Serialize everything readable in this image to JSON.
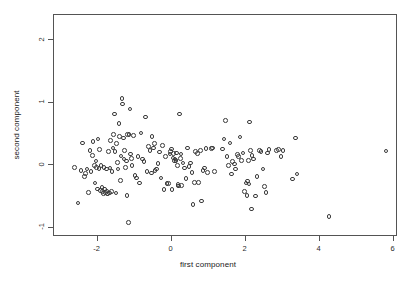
{
  "chart_data": {
    "type": "scatter",
    "title": "",
    "xlabel": "first component",
    "ylabel": "second component",
    "xlim": [
      -3.18,
      6.12
    ],
    "ylim": [
      -1.15,
      2.4
    ],
    "xticks": [
      -2,
      0,
      2,
      4,
      6
    ],
    "xticklabels": [
      "-2",
      "0",
      "2",
      "4",
      "6"
    ],
    "yticks": [
      2,
      1,
      0,
      -1
    ],
    "yticklabels": [
      "2",
      "1",
      "0",
      "-1"
    ],
    "grid": false,
    "legend": null,
    "marker": "open-circle",
    "marker_color": "#3a3a3a",
    "n_points": 178,
    "points": [
      [
        -2.6,
        -0.05
      ],
      [
        -2.5,
        -0.62
      ],
      [
        -2.42,
        -0.1
      ],
      [
        -2.38,
        0.34
      ],
      [
        -2.33,
        -0.2
      ],
      [
        -2.3,
        -0.15
      ],
      [
        -2.26,
        -0.08
      ],
      [
        -2.22,
        -0.45
      ],
      [
        -2.18,
        0.22
      ],
      [
        -2.15,
        -0.12
      ],
      [
        -2.12,
        0.14
      ],
      [
        -2.1,
        0.36
      ],
      [
        -2.06,
        -0.02
      ],
      [
        -2.04,
        -0.3
      ],
      [
        -2.02,
        0.05
      ],
      [
        -2.0,
        -0.05
      ],
      [
        -1.98,
        -0.4
      ],
      [
        -1.96,
        0.4
      ],
      [
        -1.94,
        -0.07
      ],
      [
        -1.92,
        0.23
      ],
      [
        -1.9,
        -0.42
      ],
      [
        -1.88,
        -0.02
      ],
      [
        -1.86,
        -0.37
      ],
      [
        -1.84,
        -0.44
      ],
      [
        -1.82,
        -0.47
      ],
      [
        -1.8,
        -0.05
      ],
      [
        -1.78,
        -0.4
      ],
      [
        -1.76,
        -0.45
      ],
      [
        -1.74,
        -0.08
      ],
      [
        -1.72,
        -0.43
      ],
      [
        -1.7,
        -0.48
      ],
      [
        -1.68,
        0.2
      ],
      [
        -1.66,
        -0.46
      ],
      [
        -1.64,
        -0.06
      ],
      [
        -1.62,
        0.38
      ],
      [
        -1.6,
        -0.44
      ],
      [
        -1.58,
        -0.12
      ],
      [
        -1.56,
        0.26
      ],
      [
        -1.54,
        0.47
      ],
      [
        -1.52,
        0.8
      ],
      [
        -1.5,
        0.2
      ],
      [
        -1.48,
        -0.46
      ],
      [
        -1.46,
        0.33
      ],
      [
        -1.44,
        0.03
      ],
      [
        -1.42,
        -0.08
      ],
      [
        -1.4,
        0.65
      ],
      [
        -1.38,
        0.44
      ],
      [
        -1.36,
        -0.26
      ],
      [
        -1.34,
        0.13
      ],
      [
        -1.32,
        1.05
      ],
      [
        -1.3,
        0.96
      ],
      [
        -1.28,
        0.42
      ],
      [
        -1.26,
        0.08
      ],
      [
        -1.24,
        0.22
      ],
      [
        -1.22,
        -0.05
      ],
      [
        -1.2,
        0.05
      ],
      [
        -1.18,
        -0.5
      ],
      [
        -1.16,
        0.47
      ],
      [
        -1.14,
        -0.93
      ],
      [
        -1.12,
        0.47
      ],
      [
        -1.1,
        0.88
      ],
      [
        -1.08,
        0.16
      ],
      [
        -1.06,
        0.09
      ],
      [
        -1.04,
        -0.02
      ],
      [
        -1.0,
        0.46
      ],
      [
        -0.96,
        -0.18
      ],
      [
        -0.92,
        -0.22
      ],
      [
        -0.88,
        0.12
      ],
      [
        -0.84,
        -0.3
      ],
      [
        -0.8,
        0.5
      ],
      [
        -0.76,
        0.08
      ],
      [
        -0.72,
        0.04
      ],
      [
        -0.68,
        0.75
      ],
      [
        -0.64,
        -0.12
      ],
      [
        -0.6,
        0.28
      ],
      [
        -0.56,
        0.22
      ],
      [
        -0.52,
        -0.14
      ],
      [
        -0.5,
        0.44
      ],
      [
        -0.46,
        0.26
      ],
      [
        -0.44,
        0.33
      ],
      [
        -0.42,
        -0.1
      ],
      [
        -0.38,
        -0.08
      ],
      [
        -0.34,
        0.01
      ],
      [
        -0.3,
        0.19
      ],
      [
        -0.26,
        -0.22
      ],
      [
        -0.22,
        0.3
      ],
      [
        -0.18,
        -0.41
      ],
      [
        -0.14,
        0.12
      ],
      [
        -0.1,
        -0.31
      ],
      [
        -0.06,
        -0.31
      ],
      [
        -0.02,
        0.16
      ],
      [
        0.0,
        0.2
      ],
      [
        0.02,
        0.24
      ],
      [
        0.04,
        -0.41
      ],
      [
        0.06,
        0.1
      ],
      [
        0.08,
        0.17
      ],
      [
        0.1,
        0.05
      ],
      [
        0.12,
        0.08
      ],
      [
        0.14,
        0.06
      ],
      [
        0.16,
        0.18
      ],
      [
        0.18,
        -0.02
      ],
      [
        0.2,
        -0.33
      ],
      [
        0.22,
        -0.35
      ],
      [
        0.24,
        0.8
      ],
      [
        0.26,
        0.09
      ],
      [
        0.28,
        0.16
      ],
      [
        0.3,
        -0.34
      ],
      [
        0.34,
        0.02
      ],
      [
        0.38,
        -0.06
      ],
      [
        0.42,
        -0.23
      ],
      [
        0.46,
        0.26
      ],
      [
        0.5,
        -0.04
      ],
      [
        0.54,
        0.02
      ],
      [
        0.58,
        -0.13
      ],
      [
        0.6,
        -0.65
      ],
      [
        0.64,
        -0.29
      ],
      [
        0.68,
        0.2
      ],
      [
        0.72,
        0.17
      ],
      [
        0.76,
        -0.29
      ],
      [
        0.8,
        0.22
      ],
      [
        0.84,
        -0.59
      ],
      [
        0.88,
        -0.1
      ],
      [
        0.92,
        -0.06
      ],
      [
        0.96,
        0.25
      ],
      [
        1.0,
        -0.13
      ],
      [
        1.1,
        0.25
      ],
      [
        1.14,
        0.26
      ],
      [
        1.18,
        -0.12
      ],
      [
        1.4,
        0.24
      ],
      [
        1.44,
        0.4
      ],
      [
        1.48,
        0.7
      ],
      [
        1.52,
        0.12
      ],
      [
        1.56,
        -0.02
      ],
      [
        1.6,
        0.34
      ],
      [
        1.64,
        -0.16
      ],
      [
        1.68,
        0.04
      ],
      [
        1.72,
        0.0
      ],
      [
        1.76,
        -0.08
      ],
      [
        1.8,
        0.15
      ],
      [
        1.84,
        0.12
      ],
      [
        1.88,
        0.43
      ],
      [
        1.92,
        0.06
      ],
      [
        1.96,
        0.18
      ],
      [
        2.0,
        -0.44
      ],
      [
        2.04,
        -0.3
      ],
      [
        2.06,
        -0.5
      ],
      [
        2.08,
        -0.27
      ],
      [
        2.1,
        0.06
      ],
      [
        2.12,
        -0.32
      ],
      [
        2.14,
        0.67
      ],
      [
        2.16,
        0.22
      ],
      [
        2.18,
        -0.72
      ],
      [
        2.2,
        0.14
      ],
      [
        2.24,
        0.08
      ],
      [
        2.3,
        -0.51
      ],
      [
        2.34,
        -0.2
      ],
      [
        2.4,
        0.22
      ],
      [
        2.44,
        0.2
      ],
      [
        2.5,
        -0.08
      ],
      [
        2.54,
        -0.36
      ],
      [
        2.58,
        -0.45
      ],
      [
        2.62,
        0.18
      ],
      [
        2.66,
        0.23
      ],
      [
        2.86,
        0.22
      ],
      [
        2.92,
        0.23
      ],
      [
        2.98,
        0.12
      ],
      [
        3.04,
        0.22
      ],
      [
        3.3,
        -0.24
      ],
      [
        3.38,
        0.42
      ],
      [
        3.42,
        -0.16
      ],
      [
        4.28,
        -0.84
      ],
      [
        5.82,
        0.21
      ]
    ]
  },
  "axis_labels": {
    "x_title": "first component",
    "y_title": "second component"
  }
}
